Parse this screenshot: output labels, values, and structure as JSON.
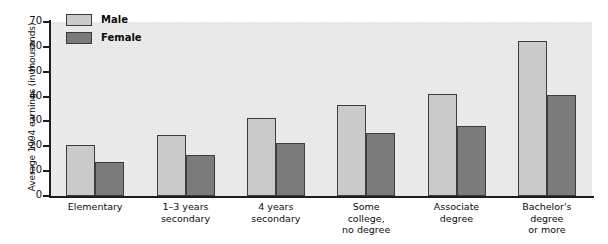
{
  "chart_data": {
    "type": "bar",
    "title": "",
    "xlabel": "",
    "ylabel": "Average 1994 earnings (in thousands)",
    "ylim": [
      0,
      70
    ],
    "yticks": [
      0,
      10,
      20,
      30,
      40,
      50,
      60,
      70
    ],
    "grid": false,
    "legend_position": "top-left",
    "categories": [
      "Elementary",
      "1–3 years secondary",
      "4 years secondary",
      "Some college, no degree",
      "Associate degree",
      "Bachelor's degree or more"
    ],
    "category_lines": [
      [
        "Elementary"
      ],
      [
        "1–3 years",
        "secondary"
      ],
      [
        "4 years",
        "secondary"
      ],
      [
        "Some",
        "college,",
        "no degree"
      ],
      [
        "Associate",
        "degree"
      ],
      [
        "Bachelor's",
        "degree",
        "or more"
      ]
    ],
    "series": [
      {
        "name": "Male",
        "color": "#cacaca",
        "values": [
          20.5,
          24.5,
          31.5,
          36.5,
          41.0,
          62.5
        ]
      },
      {
        "name": "Female",
        "color": "#7b7b7b",
        "values": [
          13.5,
          16.5,
          21.5,
          25.5,
          28.0,
          40.5
        ]
      }
    ]
  },
  "legend": {
    "items": [
      {
        "label": "Male",
        "swatch": "male"
      },
      {
        "label": "Female",
        "swatch": "female"
      }
    ]
  }
}
